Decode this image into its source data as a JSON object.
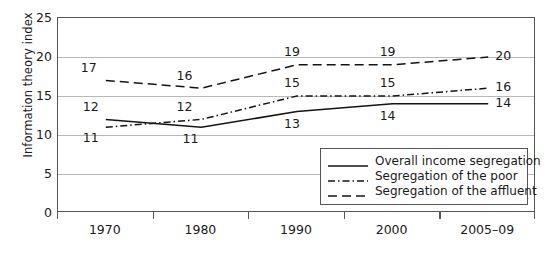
{
  "chart_data": {
    "type": "line",
    "title": "",
    "xlabel": "",
    "ylabel": "Information theory index",
    "categories": [
      "1970",
      "1980",
      "1990",
      "2000",
      "2005–09"
    ],
    "ylim": [
      0,
      25
    ],
    "yticks": [
      0,
      5,
      10,
      15,
      20,
      25
    ],
    "grid": true,
    "legend_position": "bottom-right",
    "series": [
      {
        "name": "Overall income segregation",
        "style": "solid",
        "values": [
          12,
          11,
          13,
          14,
          14
        ]
      },
      {
        "name": "Segregation of the poor",
        "style": "dashdot",
        "values": [
          11,
          12,
          15,
          15,
          16
        ]
      },
      {
        "name": "Segregation of the affluent",
        "style": "dashed",
        "values": [
          17,
          16,
          19,
          19,
          20
        ]
      }
    ]
  },
  "axis": {
    "y_tick_labels": [
      "25",
      "20",
      "15",
      "10",
      "5",
      "0"
    ],
    "x_tick_labels": [
      "1970",
      "1980",
      "1990",
      "2000",
      "2005–09"
    ],
    "y_title": "Information theory index"
  },
  "point_labels": {
    "overall": [
      "12",
      "11",
      "13",
      "14",
      "14"
    ],
    "poor": [
      "11",
      "12",
      "15",
      "15",
      "16"
    ],
    "affluent": [
      "17",
      "16",
      "19",
      "19",
      "20"
    ]
  },
  "legend": {
    "items": [
      {
        "label": "Overall income segregation",
        "style": "solid"
      },
      {
        "label": "Segregation of the poor",
        "style": "dashdot"
      },
      {
        "label": "Segregation of the affluent",
        "style": "dashed"
      }
    ]
  },
  "colors": {
    "line": "#141414",
    "frame": "#555555",
    "grid": "#b9b9b9",
    "text": "#1a1a1a",
    "background": "#ffffff"
  }
}
